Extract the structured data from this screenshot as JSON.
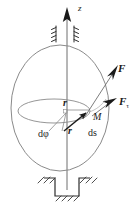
{
  "figure": {
    "kind": "mechanics-diagram",
    "colors": {
      "outline": "#6e6e6e",
      "ink": "#1a1a1a",
      "hatch": "#3a3a3a",
      "background": "#ffffff"
    },
    "labels": {
      "axis_z": "z",
      "force": "F",
      "force_tangential_symbol": "F",
      "force_tangential_subscript": "τ",
      "point_M": "M",
      "radius_top": "r",
      "radius_vector": "r",
      "angle_increment": "dφ",
      "arc_increment": "ds"
    },
    "geometry": {
      "sphere_center_x": 60,
      "sphere_center_y": 108,
      "sphere_rx": 49,
      "sphere_ry": 63,
      "latitude_center_x": 54,
      "latitude_center_y": 111,
      "latitude_rx": 36,
      "latitude_ry": 12,
      "point_M_x": 90,
      "point_M_y": 112,
      "axis_top_y": 8,
      "axis_bottom_y": 190
    },
    "elements": [
      "z-axis-arrow",
      "upper-bearing",
      "sphere-outline",
      "latitude-ellipse",
      "radius-segment",
      "radius-vector",
      "force-vector",
      "tangential-force-vector",
      "angle-wedge",
      "lower-thrust-bearing"
    ]
  }
}
